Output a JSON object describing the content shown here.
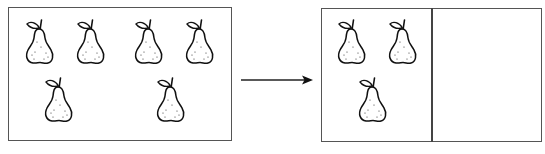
{
  "diagram": {
    "source_box": {
      "item": "pear",
      "count": 6,
      "items": [
        {
          "x": 22,
          "y": 17
        },
        {
          "x": 73,
          "y": 17
        },
        {
          "x": 131,
          "y": 17
        },
        {
          "x": 182,
          "y": 17
        },
        {
          "x": 41,
          "y": 75
        },
        {
          "x": 153,
          "y": 75
        }
      ]
    },
    "arrow": {
      "direction": "right"
    },
    "target_box": {
      "sections": 2,
      "section_1": {
        "item": "pear",
        "count": 3,
        "items": [
          {
            "x": 334,
            "y": 17
          },
          {
            "x": 385,
            "y": 17
          },
          {
            "x": 355,
            "y": 75
          }
        ]
      },
      "section_2": {
        "item": "pear",
        "count": 0,
        "items": []
      }
    },
    "colors": {
      "stroke": "#111111",
      "border": "#555555",
      "background": "#ffffff"
    }
  }
}
